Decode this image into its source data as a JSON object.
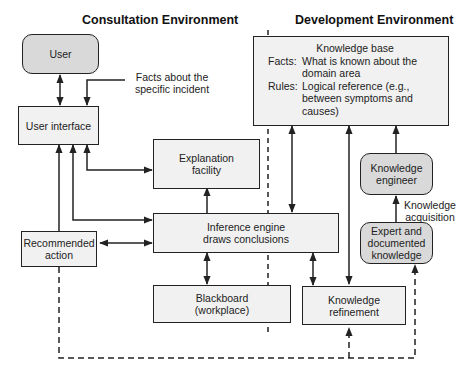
{
  "headings": {
    "consultation": "Consultation Environment",
    "development": "Development Environment"
  },
  "boxes": {
    "user": "User",
    "user_interface": "User interface",
    "explanation_facility": [
      "Explanation",
      "facility"
    ],
    "inference_engine": [
      "Inference engine",
      "draws conclusions"
    ],
    "recommended_action": [
      "Recommended",
      "action"
    ],
    "blackboard": [
      "Blackboard",
      "(workplace)"
    ],
    "knowledge_refinement": [
      "Knowledge",
      "refinement"
    ],
    "knowledge_engineer": [
      "Knowledge",
      "engineer"
    ],
    "expert_knowledge": [
      "Expert and",
      "documented",
      "knowledge"
    ]
  },
  "knowledge_base": {
    "title": "Knowledge base",
    "facts_key": "Facts:",
    "facts_value": "What is known about the domain area",
    "rules_key": "Rules:",
    "rules_value": "Logical reference (e.g., between symptoms and causes)"
  },
  "annotations": {
    "facts_incident": [
      "Facts about the",
      "specific incident"
    ],
    "knowledge_acquisition": [
      "Knowledge",
      "acquisition"
    ]
  },
  "colors": {
    "line": "#222222",
    "box_fill": "#f1f1f1",
    "rounded_fill": "#d9d9d9"
  }
}
